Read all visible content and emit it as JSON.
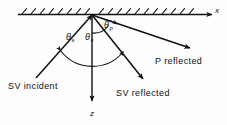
{
  "figure": {
    "kind": "seismic-wave-reflection-diagram",
    "background_color": "#fdfdfd",
    "ink_color": "#111111"
  },
  "axes": {
    "x_label": "x",
    "z_label": "z",
    "x_axis_direction": "right",
    "z_axis_direction": "down"
  },
  "surface": {
    "name": "free-surface",
    "hatching": "diagonal ticks above the line",
    "hatch_count": 19
  },
  "angles": [
    {
      "id": "theta-s-left",
      "symbol": "θ",
      "subscript": "s"
    },
    {
      "id": "theta-s-right",
      "symbol": "θ",
      "subscript": "s"
    },
    {
      "id": "theta-p",
      "symbol": "θ",
      "subscript": "p"
    }
  ],
  "rays": [
    {
      "id": "sv-incident",
      "label": "SV incident",
      "direction": "up-right toward origin"
    },
    {
      "id": "sv-reflected",
      "label": "SV reflected",
      "direction": "down-right from origin"
    },
    {
      "id": "p-reflected",
      "label": "P reflected",
      "direction": "down-right shallow from origin"
    }
  ],
  "labels": {
    "x": "x",
    "z": "z",
    "theta_symbol": "θ",
    "sub_s": "s",
    "sub_p": "p",
    "sv_incident": "SV incident",
    "sv_reflected": "SV reflected",
    "p_reflected": "P reflected"
  }
}
